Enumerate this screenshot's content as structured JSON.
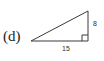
{
  "figure": {
    "part_label": "(d)",
    "stroke_color": "#3a3a3a",
    "background_color": "#ffffff",
    "shape": "right-triangle"
  },
  "labels": {
    "base": "15",
    "height": "8"
  },
  "diagram_data": {
    "type": "geometry-diagram",
    "shape": "right triangle",
    "vertices": {
      "left": [
        31,
        41
      ],
      "right_angle": [
        88,
        41
      ],
      "apex": [
        88,
        11
      ]
    },
    "sides": [
      {
        "name": "base",
        "label": "15",
        "from": "left",
        "to": "right_angle"
      },
      {
        "name": "height",
        "label": "8",
        "from": "right_angle",
        "to": "apex"
      },
      {
        "name": "hypotenuse",
        "label": "",
        "from": "left",
        "to": "apex"
      }
    ],
    "right_angle_marker": {
      "at": "right_angle",
      "size": 6
    }
  }
}
